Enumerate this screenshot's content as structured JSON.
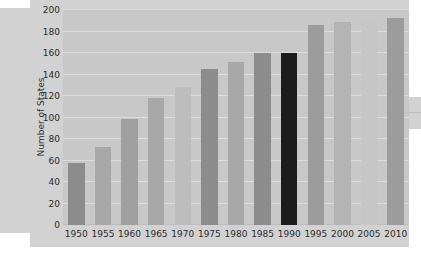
{
  "chart_data": {
    "type": "bar",
    "title": "",
    "xlabel": "",
    "ylabel": "Number of States",
    "categories": [
      "1950",
      "1955",
      "1960",
      "1965",
      "1970",
      "1975",
      "1980",
      "1985",
      "1990",
      "1995",
      "2000",
      "2005",
      "2010"
    ],
    "values": [
      58,
      73,
      99,
      118,
      128,
      145,
      152,
      160,
      160,
      186,
      189,
      191,
      193
    ],
    "ylim": [
      0,
      200
    ],
    "yticks": [
      0,
      20,
      40,
      60,
      80,
      100,
      120,
      140,
      160,
      180,
      200
    ],
    "ytick_labels": [
      "0",
      "20",
      "40",
      "60",
      "80",
      "100",
      "120",
      "140",
      "160",
      "180",
      "200"
    ],
    "grid": true,
    "legend": "none",
    "bar_colors": [
      "#8c8c8c",
      "#a8a8a8",
      "#a0a0a0",
      "#a8a8a8",
      "#bdbdbd",
      "#8c8c8c",
      "#a8a8a8",
      "#8c8c8c",
      "#1c1c1c",
      "#9c9c9c",
      "#b4b4b4",
      "#c6c6c6",
      "#9c9c9c"
    ],
    "plot_background": "#c8c8c8",
    "figure_background": "#d2d2d2",
    "gridline_color": "#dcdcdc",
    "text_color": "#2b2b2b"
  }
}
